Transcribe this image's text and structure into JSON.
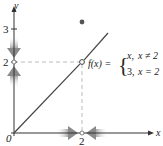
{
  "figure": {
    "function_label": "f(x) =",
    "cases": [
      {
        "value": "x,",
        "condition": "x ≠ 2"
      },
      {
        "value": "3,",
        "condition": "x = 2"
      }
    ],
    "axes": {
      "x_label": "x",
      "y_label": "y",
      "origin_label": "0",
      "x_ticks": [
        "2"
      ],
      "y_ticks": [
        "2",
        "3"
      ]
    },
    "points": {
      "open_circle": {
        "x": 2,
        "y": 2
      },
      "filled_dot": {
        "x": 2,
        "y": 3
      }
    },
    "colors": {
      "line": "#444444",
      "arrows": "#9a9a9a",
      "dashed": "#bbbbbb"
    }
  }
}
